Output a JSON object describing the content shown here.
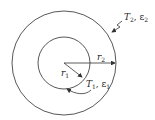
{
  "diagram": {
    "outer_circle": {
      "cx": 64,
      "cy": 63,
      "r": 52
    },
    "inner_circle": {
      "cx": 64,
      "cy": 63,
      "r": 26
    },
    "labels": {
      "outer_surface": {
        "T": "T",
        "T_sub": "2",
        "eps": "ε",
        "eps_sub": "2"
      },
      "inner_surface": {
        "T": "T",
        "T_sub": "1",
        "eps": "ε",
        "eps_sub": "1"
      },
      "r2": {
        "r": "r",
        "sub": "2"
      },
      "r1": {
        "r": "r",
        "sub": "1"
      }
    },
    "stroke_color": "#333333"
  }
}
